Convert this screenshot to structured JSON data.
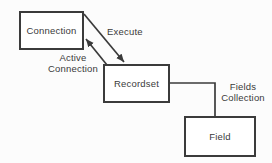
{
  "diagram": {
    "background_color": "#fcfcfc",
    "line_color": "#3b3b3b",
    "box_fill_color": "#ffffff",
    "text_color": "#3a3a3a",
    "nodes": [
      {
        "id": "connection",
        "label": "Connection"
      },
      {
        "id": "recordset",
        "label": "Recordset"
      },
      {
        "id": "field",
        "label": "Field"
      }
    ],
    "edges": [
      {
        "id": "execute",
        "from": "Connection",
        "to": "Recordset",
        "label": "Execute",
        "arrowhead": true
      },
      {
        "id": "active-connection",
        "from": "Recordset",
        "to": "Connection",
        "label_line1": "Active",
        "label_line2": "Connection",
        "arrowhead": true
      },
      {
        "id": "fields-collection",
        "from": "Recordset",
        "to": "Field",
        "label_line1": "Fields",
        "label_line2": "Collection",
        "arrowhead": false
      }
    ]
  }
}
